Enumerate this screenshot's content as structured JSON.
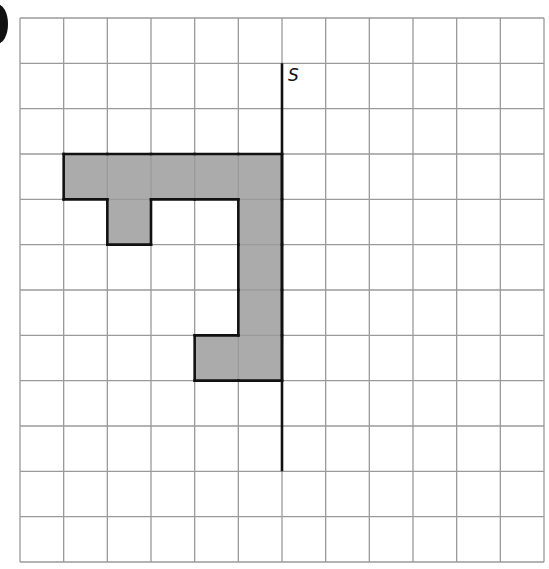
{
  "figure": {
    "label": "S",
    "corner_mark": "b)",
    "grid": {
      "cols": 12,
      "rows": 12,
      "left": 20,
      "top": 18,
      "right": 544,
      "bottom": 562,
      "line_color": "#9a9a9a"
    },
    "mirror_line": {
      "name": "S",
      "col_line": 6,
      "from_row": 1,
      "to_row": 10,
      "color": "#111111"
    },
    "shape": {
      "fill": "#ababab",
      "outline": "#111111",
      "cells": [
        [
          1,
          3
        ],
        [
          2,
          3
        ],
        [
          3,
          3
        ],
        [
          4,
          3
        ],
        [
          5,
          3
        ],
        [
          2,
          4
        ],
        [
          5,
          4
        ],
        [
          5,
          5
        ],
        [
          5,
          6
        ],
        [
          4,
          7
        ],
        [
          5,
          7
        ]
      ]
    }
  }
}
